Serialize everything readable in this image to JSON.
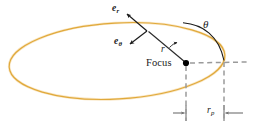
{
  "figure": {
    "width": 255,
    "height": 129,
    "background_color": "#ffffff"
  },
  "colors": {
    "orbit": "#e0a93b",
    "orbit_shadow": "#f2c878",
    "vector": "#1a1a1a",
    "radius_line": "#2b2b2b",
    "dashed": "#9a9a9a",
    "arc": "#1a1a1a",
    "text": "#1a1a1a",
    "focus_dot": "#000000"
  },
  "labels": {
    "e_r": {
      "symbol": "e",
      "subscript": "r",
      "name": "radial-unit-vector"
    },
    "e_theta": {
      "symbol": "e",
      "subscript": "θ",
      "name": "transverse-unit-vector"
    },
    "radius": {
      "symbol": "r",
      "name": "radius-label"
    },
    "angle": {
      "symbol": "θ",
      "name": "true-anomaly-label"
    },
    "focus": {
      "text": "Focus",
      "name": "focus-label"
    },
    "perihelion": {
      "symbol": "r",
      "subscript": "p",
      "name": "perihelion-distance-label"
    }
  },
  "geometry": {
    "ellipse": {
      "center_x": 117,
      "center_y": 61,
      "semi_major": 108,
      "semi_minor": 38,
      "rotation_deg": -3.2
    },
    "focus": {
      "x": 186,
      "y": 63
    },
    "orbit_point": {
      "x": 147,
      "y": 31
    },
    "perihelion_point": {
      "x": 224,
      "y": 61
    },
    "dimension_y": 113,
    "axis_line_y": 63,
    "axis_line_x_end": 248
  }
}
